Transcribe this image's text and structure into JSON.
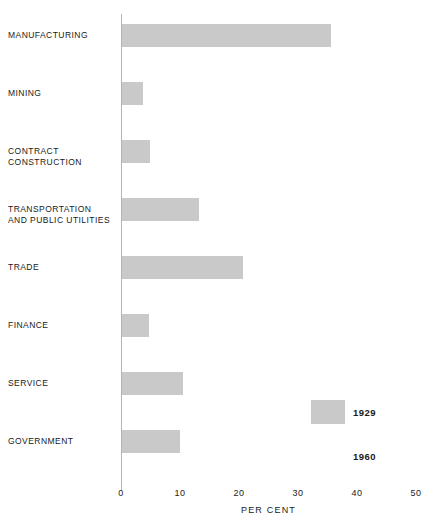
{
  "chart_data": {
    "type": "bar",
    "orientation": "horizontal",
    "title": "",
    "xlabel": "PER CENT",
    "ylabel": "",
    "xlim": [
      0,
      50
    ],
    "xticks": [
      0,
      10,
      20,
      30,
      40,
      50
    ],
    "xtick_labels": [
      "0",
      "10",
      "20",
      "30",
      "40",
      "50"
    ],
    "grid": false,
    "legend_position": "inside-right",
    "categories": [
      "MANUFACTURING",
      "MINING",
      "CONTRACT\nCONSTRUCTION",
      "TRANSPORTATION\nAND PUBLIC UTILITIES",
      "TRADE",
      "FINANCE",
      "SERVICE",
      "GOVERNMENT"
    ],
    "series": [
      {
        "name": "1929",
        "color": "#c9c9c9",
        "values": [
          35.4,
          3.5,
          4.8,
          13.0,
          20.5,
          4.5,
          10.3,
          9.8
        ]
      }
    ],
    "legend": [
      {
        "label": "1929",
        "swatch": "filled"
      },
      {
        "label": "1960",
        "swatch": "empty"
      }
    ]
  }
}
